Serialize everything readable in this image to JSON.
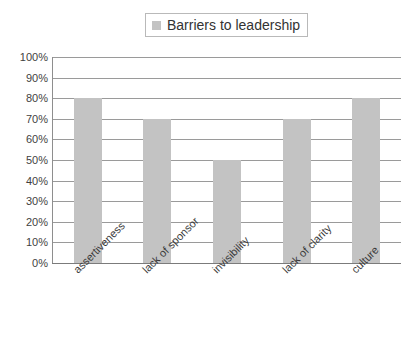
{
  "chart_data": {
    "type": "bar",
    "title": "",
    "categories": [
      "assertiveness",
      "lack of sponsor",
      "invisibility",
      "lack of clarity",
      "culture"
    ],
    "values": [
      80,
      70,
      50,
      70,
      80
    ],
    "value_suffix": "%",
    "series": [
      {
        "name": "Barriers to leadership",
        "values": [
          80,
          70,
          50,
          70,
          80
        ]
      }
    ],
    "xlabel": "",
    "ylabel": "",
    "ylim": [
      0,
      100
    ],
    "ytick_step": 10,
    "ytick_labels": [
      "100%",
      "90%",
      "80%",
      "70%",
      "60%",
      "50%",
      "40%",
      "30%",
      "20%",
      "10%",
      "0%"
    ],
    "ytick_values": [
      100,
      90,
      80,
      70,
      60,
      50,
      40,
      30,
      20,
      10,
      0
    ],
    "grid": true,
    "grid_axis": "y",
    "legend_position": "top-center",
    "bar_color": "#c3c3c3",
    "gridline_color": "#9a9a9a",
    "axis_color": "#7b7b7b",
    "background_color": "#ffffff",
    "xtick_label_rotation": -45
  },
  "legend": {
    "swatch_name": "legend-color-swatch",
    "label": "Barriers to leadership"
  }
}
